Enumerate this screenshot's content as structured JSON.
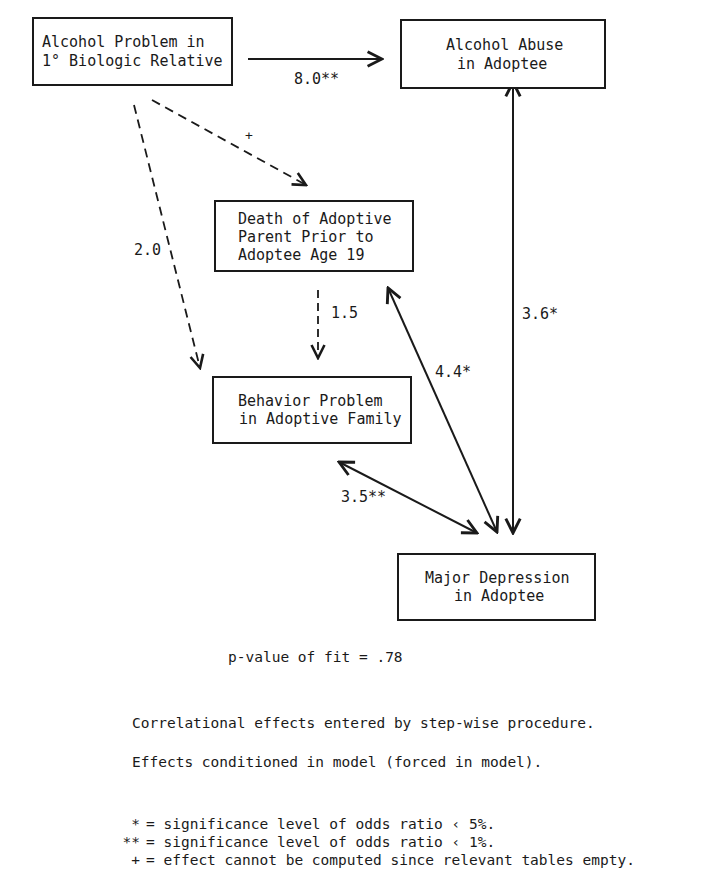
{
  "nodes": {
    "alcohol_problem_relative": {
      "line1": "Alcohol Problem in",
      "line2": "1° Biologic Relative"
    },
    "alcohol_abuse_adoptee": {
      "line1": "Alcohol Abuse",
      "line2": "in Adoptee"
    },
    "death_adoptive_parent": {
      "line1": "Death of Adoptive",
      "line2": "Parent Prior to",
      "line3": "Adoptee Age 19"
    },
    "behavior_problem_family": {
      "line1": "Behavior Problem",
      "line2": "in Adoptive Family"
    },
    "major_depression_adoptee": {
      "line1": "Major Depression",
      "line2": "in Adoptee"
    }
  },
  "edges": [
    {
      "from": "alcohol_problem_relative",
      "to": "alcohol_abuse_adoptee",
      "label": "8.0**",
      "style": "solid",
      "direction": "forward"
    },
    {
      "from": "alcohol_problem_relative",
      "to": "death_adoptive_parent",
      "label": "+",
      "style": "dashed",
      "direction": "forward"
    },
    {
      "from": "alcohol_problem_relative",
      "to": "behavior_problem_family",
      "label": "2.0",
      "style": "dashed",
      "direction": "forward"
    },
    {
      "from": "death_adoptive_parent",
      "to": "behavior_problem_family",
      "label": "1.5",
      "style": "dashed",
      "direction": "forward"
    },
    {
      "from": "death_adoptive_parent",
      "to": "major_depression_adoptee",
      "label": "4.4*",
      "style": "solid",
      "direction": "both"
    },
    {
      "from": "behavior_problem_family",
      "to": "major_depression_adoptee",
      "label": "3.5**",
      "style": "solid",
      "direction": "both"
    },
    {
      "from": "alcohol_abuse_adoptee",
      "to": "major_depression_adoptee",
      "label": "3.6*",
      "style": "solid",
      "direction": "both"
    }
  ],
  "fit": {
    "text": "p-value of fit = .78"
  },
  "notes": {
    "correlational": "Correlational effects entered by step-wise procedure.",
    "conditioned": "Effects conditioned in model (forced in model)."
  },
  "legend": [
    {
      "symbol": "*",
      "text": "= significance level of odds ratio ‹ 5%."
    },
    {
      "symbol": "**",
      "text": "= significance level of odds ratio ‹ 1%."
    },
    {
      "symbol": "+",
      "text": "= effect cannot be computed since relevant tables empty."
    }
  ],
  "colors": {
    "ink": "#1a1a1a",
    "background": "#ffffff"
  }
}
